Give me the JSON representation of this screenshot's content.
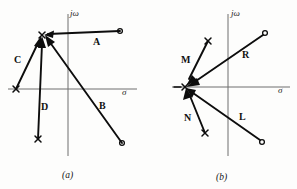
{
  "figure": {
    "background_color": "#fdfdfc",
    "ink_color": "#0d0d0d",
    "axis_color": "#6f6f6f",
    "panels": [
      {
        "id": "panel-a",
        "caption": "(a)",
        "caption_pos": [
          68,
          175
        ],
        "axes": {
          "imaginary_label": "jω",
          "imaginary_label_pos": [
            70,
            16
          ],
          "real_label": "σ",
          "real_label_pos": [
            122,
            95
          ],
          "origin": [
            68,
            89
          ],
          "vertical_line": [
            68,
            14,
            68,
            156
          ],
          "horizontal_line": [
            8,
            89,
            137,
            89
          ]
        },
        "test_point": [
          42,
          35
        ],
        "test_point_type": "pole",
        "vectors": [
          {
            "label": "A",
            "label_pos": [
              97,
              41
            ],
            "from": [
              120,
              31
            ],
            "to": [
              46,
              34
            ],
            "source_marker": "zero",
            "marker_pos": [
              120,
              31
            ]
          },
          {
            "label": "B",
            "label_pos": [
              103,
              105
            ],
            "from": [
              122,
              143
            ],
            "to": [
              46,
              38
            ],
            "source_marker": "zero",
            "marker_pos": [
              122,
              143
            ]
          },
          {
            "label": "C",
            "label_pos": [
              19,
              59
            ],
            "from": [
              16,
              89
            ],
            "to": [
              40,
              39
            ],
            "source_marker": "pole",
            "marker_pos": [
              16,
              89
            ]
          },
          {
            "label": "D",
            "label_pos": [
              45,
              106
            ],
            "from": [
              38,
              139
            ],
            "to": [
              42,
              40
            ],
            "source_marker": "pole",
            "marker_pos": [
              38,
              139
            ]
          }
        ]
      },
      {
        "id": "panel-b",
        "caption": "(b)",
        "caption_pos": [
          222,
          176
        ],
        "axes": {
          "imaginary_label": "jω",
          "imaginary_label_pos": [
            231,
            16
          ],
          "real_label": "σ",
          "real_label_pos": [
            281,
            93
          ],
          "origin": [
            228,
            87
          ],
          "vertical_line": [
            228,
            14,
            228,
            156
          ],
          "horizontal_line": [
            172,
            87,
            290,
            87
          ]
        },
        "test_point": [
          185,
          87
        ],
        "test_point_type": "pole",
        "vectors": [
          {
            "label": "M",
            "label_pos": [
              186,
              59
            ],
            "from": [
              208,
              41
            ],
            "to": [
              188,
              83
            ],
            "source_marker": "pole",
            "marker_pos": [
              208,
              41
            ]
          },
          {
            "label": "R",
            "label_pos": [
              246,
              54
            ],
            "from": [
              265,
              33
            ],
            "to": [
              190,
              85
            ],
            "source_marker": "zero",
            "marker_pos": [
              265,
              33
            ]
          },
          {
            "label": "N",
            "label_pos": [
              189,
              117
            ],
            "from": [
              205,
              133
            ],
            "to": [
              188,
              92
            ],
            "source_marker": "pole",
            "marker_pos": [
              205,
              133
            ]
          },
          {
            "label": "L",
            "label_pos": [
              243,
              116
            ],
            "from": [
              262,
              142
            ],
            "to": [
              190,
              91
            ],
            "source_marker": "zero",
            "marker_pos": [
              262,
              142
            ]
          }
        ]
      }
    ]
  }
}
